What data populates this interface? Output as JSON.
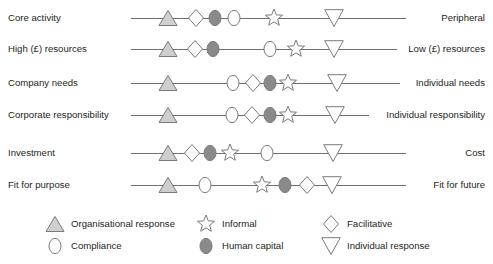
{
  "diagram": {
    "colors": {
      "line": "#6f6f6f",
      "stroke": "#7a7a7a",
      "triangle_fill": "#cfcfcf",
      "human_capital_fill": "#8a8a8a",
      "open_fill": "#ffffff",
      "text": "#231f20"
    },
    "rows": [
      {
        "left_label": "Core activity",
        "right_label": "Peripheral",
        "y": 18,
        "line_x1": 131,
        "line_x2": 406,
        "markers": [
          {
            "type": "organisational-response",
            "x": 168
          },
          {
            "type": "facilitative",
            "x": 196
          },
          {
            "type": "human-capital",
            "x": 215
          },
          {
            "type": "compliance",
            "x": 234
          },
          {
            "type": "informal",
            "x": 274
          },
          {
            "type": "individual-response",
            "x": 334
          }
        ]
      },
      {
        "left_label": "High (£) resources",
        "right_label": "Low (£) resources",
        "y": 49,
        "line_x1": 131,
        "line_x2": 397,
        "markers": [
          {
            "type": "organisational-response",
            "x": 168
          },
          {
            "type": "facilitative",
            "x": 195
          },
          {
            "type": "human-capital",
            "x": 213
          },
          {
            "type": "compliance",
            "x": 270
          },
          {
            "type": "informal",
            "x": 296
          },
          {
            "type": "individual-response",
            "x": 334
          }
        ]
      },
      {
        "left_label": "Company needs",
        "right_label": "Individual needs",
        "y": 83,
        "line_x1": 131,
        "line_x2": 400,
        "markers": [
          {
            "type": "organisational-response",
            "x": 168
          },
          {
            "type": "compliance",
            "x": 233
          },
          {
            "type": "facilitative",
            "x": 253
          },
          {
            "type": "human-capital",
            "x": 270
          },
          {
            "type": "informal",
            "x": 288
          },
          {
            "type": "individual-response",
            "x": 337
          }
        ]
      },
      {
        "left_label": "Corporate responsibility",
        "right_label": "Individual responsibility",
        "y": 115,
        "line_x1": 131,
        "line_x2": 369,
        "markers": [
          {
            "type": "organisational-response",
            "x": 168
          },
          {
            "type": "compliance",
            "x": 232
          },
          {
            "type": "facilitative",
            "x": 252
          },
          {
            "type": "human-capital",
            "x": 270
          },
          {
            "type": "informal",
            "x": 288
          },
          {
            "type": "individual-response",
            "x": 335
          }
        ]
      },
      {
        "left_label": "Investment",
        "right_label": "Cost",
        "y": 153,
        "line_x1": 131,
        "line_x2": 406,
        "markers": [
          {
            "type": "organisational-response",
            "x": 168
          },
          {
            "type": "facilitative",
            "x": 192
          },
          {
            "type": "human-capital",
            "x": 210
          },
          {
            "type": "informal",
            "x": 230
          },
          {
            "type": "compliance",
            "x": 267
          },
          {
            "type": "individual-response",
            "x": 333
          }
        ]
      },
      {
        "left_label": "Fit for purpose",
        "right_label": "Fit for future",
        "y": 185,
        "line_x1": 131,
        "line_x2": 406,
        "markers": [
          {
            "type": "organisational-response",
            "x": 168
          },
          {
            "type": "compliance",
            "x": 205
          },
          {
            "type": "informal",
            "x": 262
          },
          {
            "type": "human-capital",
            "x": 285
          },
          {
            "type": "facilitative",
            "x": 307
          },
          {
            "type": "individual-response",
            "x": 332
          }
        ]
      }
    ],
    "legend": [
      {
        "type": "organisational-response",
        "label": "Organisational response",
        "glyph_x": 55,
        "label_x": 71,
        "y": 224
      },
      {
        "type": "compliance",
        "label": "Compliance",
        "glyph_x": 55,
        "label_x": 71,
        "y": 246
      },
      {
        "type": "informal",
        "label": "Informal",
        "glyph_x": 206,
        "label_x": 222,
        "y": 224
      },
      {
        "type": "human-capital",
        "label": "Human capital",
        "glyph_x": 206,
        "label_x": 222,
        "y": 246
      },
      {
        "type": "facilitative",
        "label": "Facilitative",
        "glyph_x": 331,
        "label_x": 347,
        "y": 224
      },
      {
        "type": "individual-response",
        "label": "Individual response",
        "glyph_x": 331,
        "label_x": 347,
        "y": 246
      }
    ]
  }
}
